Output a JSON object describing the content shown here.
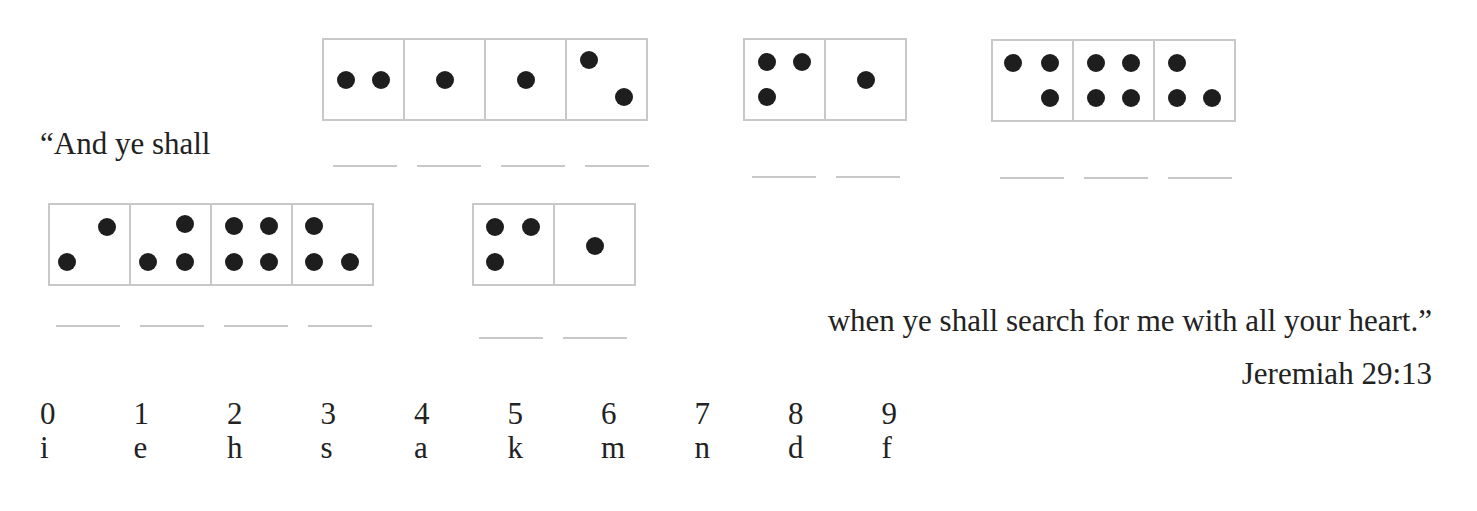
{
  "quote_start": "“And ye shall",
  "quote_end": "when ye shall search for me with all your heart.”",
  "reference": "Jeremiah 29:13",
  "puzzle": {
    "words": [
      {
        "dice": [
          {
            "pips": [
              [
                0.28,
                0.5
              ],
              [
                0.72,
                0.5
              ]
            ]
          },
          {
            "pips": [
              [
                0.5,
                0.5
              ]
            ]
          },
          {
            "pips": [
              [
                0.5,
                0.5
              ]
            ]
          },
          {
            "pips": [
              [
                0.28,
                0.25
              ],
              [
                0.72,
                0.72
              ]
            ]
          }
        ]
      },
      {
        "dice": [
          {
            "pips": [
              [
                0.28,
                0.28
              ],
              [
                0.72,
                0.28
              ],
              [
                0.28,
                0.72
              ]
            ]
          },
          {
            "pips": [
              [
                0.5,
                0.5
              ]
            ]
          }
        ]
      },
      {
        "dice": [
          {
            "pips": [
              [
                0.25,
                0.28
              ],
              [
                0.72,
                0.28
              ],
              [
                0.72,
                0.72
              ]
            ]
          },
          {
            "pips": [
              [
                0.28,
                0.28
              ],
              [
                0.72,
                0.28
              ],
              [
                0.28,
                0.72
              ],
              [
                0.72,
                0.72
              ]
            ]
          },
          {
            "pips": [
              [
                0.28,
                0.28
              ],
              [
                0.28,
                0.72
              ],
              [
                0.72,
                0.72
              ]
            ]
          }
        ]
      },
      {
        "dice": [
          {
            "pips": [
              [
                0.72,
                0.28
              ],
              [
                0.22,
                0.72
              ]
            ]
          },
          {
            "pips": [
              [
                0.68,
                0.24
              ],
              [
                0.22,
                0.72
              ],
              [
                0.68,
                0.72
              ]
            ]
          },
          {
            "pips": [
              [
                0.28,
                0.26
              ],
              [
                0.72,
                0.26
              ],
              [
                0.28,
                0.72
              ],
              [
                0.72,
                0.72
              ]
            ]
          },
          {
            "pips": [
              [
                0.26,
                0.26
              ],
              [
                0.26,
                0.72
              ],
              [
                0.72,
                0.72
              ]
            ]
          }
        ]
      },
      {
        "dice": [
          {
            "pips": [
              [
                0.26,
                0.28
              ],
              [
                0.72,
                0.28
              ],
              [
                0.26,
                0.72
              ]
            ]
          },
          {
            "pips": [
              [
                0.5,
                0.52
              ]
            ]
          }
        ]
      }
    ]
  },
  "key": {
    "digits": [
      "0",
      "1",
      "2",
      "3",
      "4",
      "5",
      "6",
      "7",
      "8",
      "9"
    ],
    "letters": [
      "i",
      "e",
      "h",
      "s",
      "a",
      "k",
      "m",
      "n",
      "d",
      "f"
    ]
  }
}
